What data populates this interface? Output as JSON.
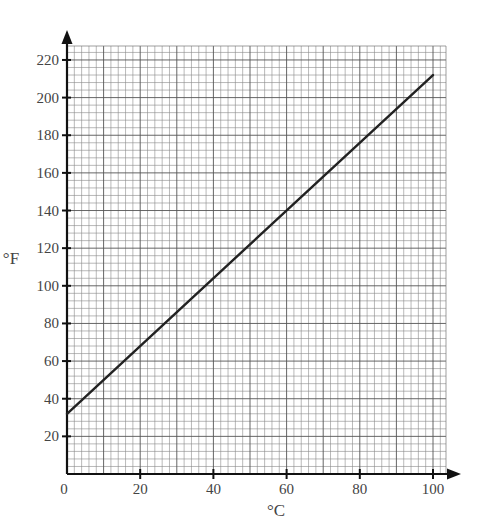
{
  "chart_data": {
    "type": "line",
    "title": "",
    "xlabel": "°C",
    "ylabel": "°F",
    "xlim": [
      0,
      100
    ],
    "ylim": [
      0,
      228
    ],
    "x_ticks": [
      0,
      20,
      40,
      60,
      80,
      100
    ],
    "y_ticks": [
      20,
      40,
      60,
      80,
      100,
      120,
      140,
      160,
      180,
      200,
      220
    ],
    "x_tick_labels": [
      "0",
      "20",
      "40",
      "60",
      "80",
      "100"
    ],
    "y_tick_labels": [
      "20",
      "40",
      "60",
      "80",
      "100",
      "120",
      "140",
      "160",
      "180",
      "200",
      "220"
    ],
    "grid": true,
    "grid_minor_x_step": 2,
    "grid_minor_y_step": 4,
    "legend": null,
    "series": [
      {
        "name": "Celsius to Fahrenheit",
        "x": [
          0,
          100
        ],
        "y": [
          32,
          212
        ],
        "color": "#222222"
      }
    ]
  },
  "layout": {
    "origin_px": [
      67,
      474
    ],
    "x_px_per_unit": 3.66,
    "y_px_per_unit": 1.882,
    "grid_right_px": 446,
    "grid_top_px": 46,
    "x_arrow_end_px": 461,
    "y_arrow_end_px": 30
  }
}
